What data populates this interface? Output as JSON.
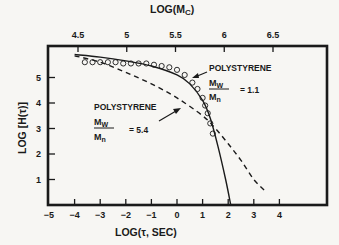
{
  "chart_data": {
    "type": "line",
    "title": "",
    "xlabel": "LOG(τ, SEC)",
    "ylabel": "LOG [H(τ)]",
    "top_xlabel": "LOG(M_C)",
    "xlim": [
      -5,
      6
    ],
    "ylim": [
      0,
      6
    ],
    "grid": false,
    "x_ticks": [
      -5,
      -4,
      -3,
      -2,
      -1,
      0,
      1,
      2,
      3,
      4
    ],
    "x_tick_labels": [
      "−5",
      "−4",
      "−3",
      "−2",
      "−1",
      "0",
      "1",
      "2",
      "3",
      "4"
    ],
    "y_ticks": [
      1,
      2,
      3,
      4,
      5
    ],
    "y_tick_labels": [
      "1",
      "2",
      "3",
      "4",
      "5"
    ],
    "top_x_ticks": [
      4.5,
      5,
      5.5,
      6,
      6.5
    ],
    "top_x_tick_labels": [
      "4.5",
      "5",
      "5.5",
      "6",
      "6.5"
    ],
    "series": [
      {
        "name": "Polystyrene Mw/Mn = 1.1 (theory, solid)",
        "style": "solid",
        "x": [
          -4.0,
          -3.0,
          -2.0,
          -1.0,
          0.0,
          0.5,
          1.0,
          1.3,
          1.6,
          1.9,
          2.1
        ],
        "y": [
          5.9,
          5.8,
          5.65,
          5.45,
          5.1,
          4.75,
          4.1,
          3.4,
          2.3,
          1.0,
          0.0
        ]
      },
      {
        "name": "Polystyrene Mw/Mn = 1.1 (data, circles)",
        "style": "markers",
        "x": [
          -3.6,
          -3.3,
          -3.0,
          -2.7,
          -2.4,
          -2.1,
          -1.8,
          -1.5,
          -1.2,
          -0.9,
          -0.6,
          -0.3,
          0.0,
          0.3,
          0.6,
          0.8,
          1.0,
          1.1,
          1.2,
          1.3,
          1.4
        ],
        "y": [
          5.6,
          5.6,
          5.6,
          5.6,
          5.6,
          5.55,
          5.55,
          5.55,
          5.55,
          5.5,
          5.45,
          5.4,
          5.3,
          5.1,
          4.8,
          4.55,
          4.2,
          3.9,
          3.6,
          3.2,
          2.8
        ]
      },
      {
        "name": "Polystyrene Mw/Mn = 5.4 (dashed)",
        "style": "dashed",
        "x": [
          -4.0,
          -3.0,
          -2.0,
          -1.0,
          0.0,
          1.0,
          1.5,
          2.0,
          2.5,
          3.0,
          3.5
        ],
        "y": [
          5.85,
          5.6,
          5.2,
          4.75,
          4.2,
          3.5,
          3.0,
          2.4,
          1.75,
          1.0,
          0.5
        ]
      }
    ],
    "annotations": [
      {
        "text": "POLYSTYRENE",
        "ratio_num": "M_W",
        "ratio_den": "M_n",
        "value": "= 1.1",
        "points_to": "solid curve with circles"
      },
      {
        "text": "POLYSTYRENE",
        "ratio_num": "M_W",
        "ratio_den": "M_n",
        "value": "= 5.4",
        "points_to": "dashed curve"
      }
    ]
  },
  "labels": {
    "top_axis_title": "LOG(M",
    "top_axis_sub": "C",
    "top_axis_close": ")",
    "x_axis_title": "LOG(τ, SEC)",
    "y_axis_title": "LOG [H(τ)]",
    "anno1_title": "POLYSTYRENE",
    "anno1_num": "M",
    "anno1_num_sub": "W",
    "anno1_den": "M",
    "anno1_den_sub": "n",
    "anno1_value": "= 1.1",
    "anno2_title": "POLYSTYRENE",
    "anno2_num": "M",
    "anno2_num_sub": "W",
    "anno2_den": "M",
    "anno2_den_sub": "n",
    "anno2_value": "= 5.4"
  }
}
